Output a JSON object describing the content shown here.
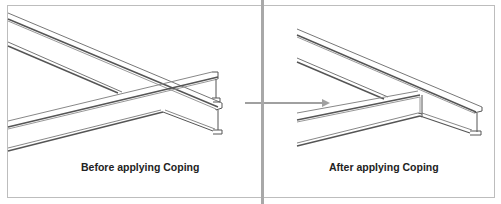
{
  "panels": [
    {
      "id": "before",
      "caption": "Before applying Coping"
    },
    {
      "id": "after",
      "caption": "After applying Coping"
    }
  ],
  "arrow": {
    "direction": "right",
    "color": "#a0a0a0"
  },
  "colors": {
    "line": "#555555",
    "line_light": "#8a8a8a",
    "frame": "#bdbdbd",
    "divider": "#a8a8a8",
    "caption": "#222222"
  }
}
